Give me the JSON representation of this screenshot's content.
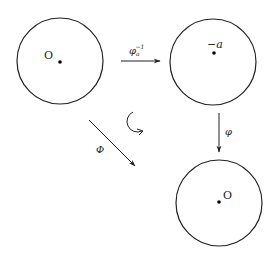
{
  "diagram": {
    "type": "commutative-diagram",
    "colors": {
      "stroke": "#222222",
      "background": "#ffffff"
    },
    "disks": [
      {
        "id": "disk-left",
        "center_label": "O",
        "point": "origin"
      },
      {
        "id": "disk-right-top",
        "center_label": "−a",
        "point": "-a"
      },
      {
        "id": "disk-right-bottom",
        "center_label": "O",
        "point": "origin"
      }
    ],
    "arrows": [
      {
        "id": "arrow-horizontal",
        "label_main": "φ",
        "label_sub": "a",
        "label_sup": "−1",
        "from": "disk-left",
        "to": "disk-right-top"
      },
      {
        "id": "arrow-vertical",
        "label": "φ",
        "from": "disk-right-top",
        "to": "disk-right-bottom"
      },
      {
        "id": "arrow-diagonal",
        "label": "Φ",
        "from": "disk-left",
        "to": "disk-right-bottom"
      }
    ],
    "rotation_symbol": "clockwise-circular-arrow"
  }
}
